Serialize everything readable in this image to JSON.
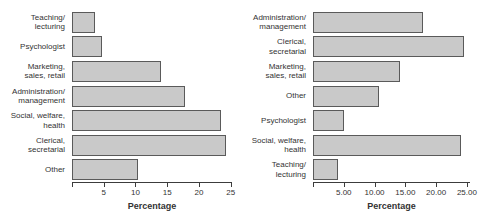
{
  "figure": {
    "background": "#ffffff",
    "bar_fill": "#c9c9c9",
    "bar_border": "#5a5a5a",
    "axis_color": "#3c3c3c",
    "text_color": "#333333"
  },
  "chart_data": [
    {
      "type": "bar",
      "orientation": "horizontal",
      "title": "",
      "xlabel": "Percentage",
      "ylabel": "",
      "xlim": [
        0,
        25.2
      ],
      "grid": false,
      "legend": null,
      "ticks": [
        5,
        10,
        15,
        20,
        25
      ],
      "tick_labels": [
        "5",
        "10",
        "15",
        "20",
        "25"
      ],
      "categories": [
        "Teaching/\nlecturing",
        "Psychologist",
        "Marketing,\nsales, retail",
        "Administration/\nmanagement",
        "Social, welfare,\nhealth",
        "Clerical,\nsecretarial",
        "Other"
      ],
      "values": [
        3.7,
        4.8,
        14.0,
        17.8,
        23.5,
        24.3,
        10.4
      ]
    },
    {
      "type": "bar",
      "orientation": "horizontal",
      "title": "",
      "xlabel": "Percentage",
      "ylabel": "",
      "xlim": [
        0,
        25.5
      ],
      "grid": false,
      "legend": null,
      "ticks": [
        5,
        10,
        15,
        20,
        25
      ],
      "tick_labels": [
        "5.00",
        "10.00",
        "15.00",
        "20.00",
        "25.00"
      ],
      "categories": [
        "Administration/\nmanagement",
        "Clerical,\nsecretarial",
        "Marketing,\nsales, retail",
        "Other",
        "Psychologist",
        "Social, welfare,\nhealth",
        "Teaching/\nlecturing"
      ],
      "values": [
        17.9,
        24.5,
        14.1,
        10.7,
        5.1,
        24.0,
        4.1
      ]
    }
  ]
}
